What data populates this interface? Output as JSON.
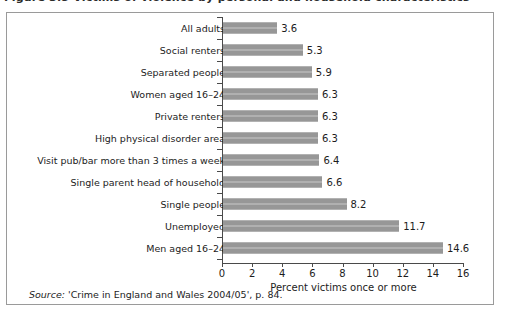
{
  "caption": {
    "text": "Figure 3.5   Victims of violence by personal and household characteristics"
  },
  "source": {
    "label": "Source:",
    "text": " 'Crime in England and Wales 2004/05', p. 84."
  },
  "colors": {
    "bar": "#9b9b9b",
    "axis": "#4a4a4a",
    "frame": "#9a9a9a",
    "text": "#1c1c1c"
  },
  "chart_data": {
    "type": "bar",
    "orientation": "horizontal",
    "title": "",
    "xlabel": "Percent victims once or more",
    "ylabel": "",
    "xlim": [
      0,
      16
    ],
    "xticks": [
      0,
      2,
      4,
      6,
      8,
      10,
      12,
      14,
      16
    ],
    "grid": false,
    "legend": null,
    "categories": [
      "All adults",
      "Social renters",
      "Separated people",
      "Women aged 16–24",
      "Private renters",
      "High physical disorder area",
      "Visit pub/bar more than 3 times a week",
      "Single parent head of household",
      "Single people",
      "Unemployed",
      "Men aged 16–24"
    ],
    "values": [
      3.6,
      5.3,
      5.9,
      6.3,
      6.3,
      6.3,
      6.4,
      6.6,
      8.2,
      11.7,
      14.6
    ],
    "value_labels": [
      "3.6",
      "5.3",
      "5.9",
      "6.3",
      "6.3",
      "6.3",
      "6.4",
      "6.6",
      "8.2",
      "11.7",
      "14.6"
    ]
  }
}
